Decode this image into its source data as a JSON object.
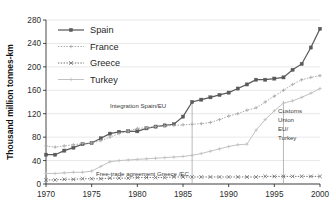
{
  "chart_data": {
    "type": "line",
    "title": "",
    "xlabel": "",
    "ylabel": "Thousand million tonnes-km",
    "xlim": [
      1970,
      2000
    ],
    "ylim": [
      0,
      280
    ],
    "xticks": [
      1970,
      1975,
      1980,
      1985,
      1990,
      1995,
      2000
    ],
    "yticks": [
      0,
      40,
      80,
      120,
      160,
      200,
      240,
      280
    ],
    "grid": true,
    "legend_position": "top-left",
    "x": [
      1970,
      1971,
      1972,
      1973,
      1974,
      1975,
      1976,
      1977,
      1978,
      1979,
      1980,
      1981,
      1982,
      1983,
      1984,
      1985,
      1986,
      1987,
      1988,
      1989,
      1990,
      1991,
      1992,
      1993,
      1994,
      1995,
      1996,
      1997,
      1998,
      1999,
      2000
    ],
    "series": [
      {
        "name": "Spain",
        "color": "#5a5a5a",
        "style": "solid",
        "marker": "square",
        "values": [
          50,
          50,
          57,
          62,
          68,
          70,
          78,
          86,
          89,
          90,
          90,
          95,
          98,
          100,
          102,
          115,
          140,
          144,
          148,
          152,
          156,
          163,
          170,
          178,
          178,
          180,
          182,
          195,
          205,
          233,
          265
        ]
      },
      {
        "name": "France",
        "color": "#a8a8a8",
        "style": "dotted",
        "marker": "plus",
        "values": [
          65,
          63,
          65,
          67,
          69,
          70,
          74,
          80,
          86,
          90,
          95,
          96,
          98,
          99,
          100,
          101,
          102,
          103,
          105,
          110,
          116,
          120,
          126,
          130,
          140,
          150,
          160,
          170,
          178,
          182,
          185
        ]
      },
      {
        "name": "Greece",
        "color": "#6f6f6f",
        "style": "dotted",
        "marker": "x",
        "values": [
          7,
          7,
          8,
          8,
          9,
          9,
          9,
          10,
          10,
          10,
          11,
          11,
          11,
          11,
          12,
          12,
          12,
          12,
          12,
          12,
          12,
          12,
          12,
          12,
          13,
          13,
          13,
          13,
          13,
          13,
          13
        ]
      },
      {
        "name": "Turkey",
        "color": "#c2c2c2",
        "style": "solid",
        "marker": "plus",
        "values": [
          18,
          18,
          19,
          20,
          20,
          22,
          30,
          38,
          40,
          41,
          42,
          43,
          44,
          45,
          46,
          47,
          49,
          52,
          56,
          60,
          64,
          67,
          68,
          92,
          110,
          125,
          138,
          142,
          148,
          155,
          163
        ]
      }
    ],
    "annotations": [
      {
        "id": "integration-spain-eu",
        "text": "Integration Spain/EU",
        "line_x": 1986,
        "line_y_top": 142,
        "line_y_bottom": 0,
        "label_lines": [
          "Integration Spain/EU"
        ]
      },
      {
        "id": "free-trade-greece-ec",
        "text": "Free-trade agreement Greece /EC",
        "line_x": 1974,
        "label_lines": [
          "Free-trade agreement Greece /EC"
        ]
      },
      {
        "id": "customs-union-eu-turkey",
        "text": "Customs Union EU/ Turkey",
        "line_x": 1996,
        "line_y_top": 142,
        "line_y_bottom": 0,
        "label_lines": [
          "Customs",
          "Union",
          "EU/",
          "Turkey"
        ]
      }
    ]
  },
  "legend": {
    "items": [
      {
        "label": "Spain"
      },
      {
        "label": "France"
      },
      {
        "label": "Greece"
      },
      {
        "label": "Turkey"
      }
    ]
  },
  "axes": {
    "y_title": "Thousand million tonnes-km",
    "y_tick_labels": [
      "280",
      "240",
      "200",
      "160",
      "120",
      "80",
      "40",
      "0"
    ],
    "x_tick_labels": [
      "1970",
      "1975",
      "1980",
      "1985",
      "1990",
      "1995",
      "2000"
    ]
  },
  "annotation_labels": {
    "integration": "Integration Spain/EU",
    "freetrade": "Free-trade agreement Greece /EC",
    "customs_1": "Customs",
    "customs_2": "Union",
    "customs_3": "EU/",
    "customs_4": "Turkey"
  },
  "colors": {
    "spain": "#5a5a5a",
    "france": "#a8a8a8",
    "greece": "#6f6f6f",
    "turkey": "#c2c2c2",
    "axis": "#333333",
    "grid": "#d8d8d8"
  }
}
